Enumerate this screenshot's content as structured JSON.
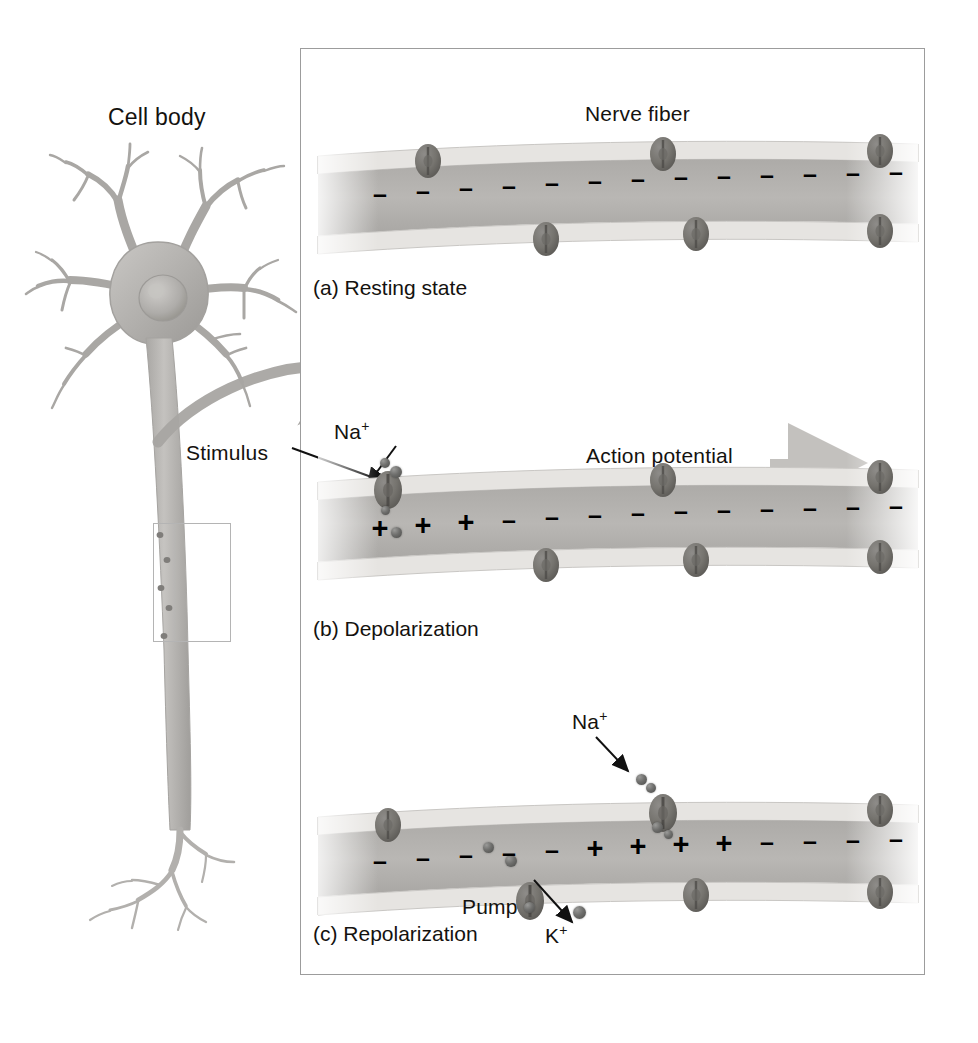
{
  "figure": {
    "title_label": "Cell body",
    "nerve_fiber_label": "Nerve fiber",
    "stimulus_label": "Stimulus"
  },
  "panels": [
    {
      "id": "resting",
      "caption": "(a) Resting state",
      "heading": "Nerve fiber",
      "charges": [
        "-",
        "-",
        "-",
        "-",
        "-",
        "-",
        "-",
        "-",
        "-",
        "-",
        "-",
        "-",
        "-"
      ],
      "channels_top": 3,
      "channels_bottom": 3,
      "annotations": []
    },
    {
      "id": "depolarization",
      "caption": "(b) Depolarization",
      "heading": "Action potential",
      "charges": [
        "+",
        "+",
        "+",
        "-",
        "-",
        "-",
        "-",
        "-",
        "-",
        "-",
        "-",
        "-",
        "-"
      ],
      "channels_top": 3,
      "channels_bottom": 3,
      "annotations": [
        "Na",
        "Stimulus",
        "Action potential"
      ]
    },
    {
      "id": "repolarization",
      "caption": "(c) Repolarization",
      "heading": "",
      "charges": [
        "-",
        "-",
        "-",
        "-",
        "-",
        "+",
        "+",
        "+",
        "+",
        "-",
        "-",
        "-",
        "-"
      ],
      "channels_top": 3,
      "channels_bottom": 3,
      "annotations": [
        "Na",
        "Pump",
        "K"
      ]
    }
  ],
  "ion_labels": {
    "sodium_base": "Na",
    "sodium_sup": "+",
    "potassium_base": "K",
    "potassium_sup": "+",
    "pump": "Pump"
  },
  "colors": {
    "frame_border": "#9c9c9c",
    "membrane_band": "#e2e0dd",
    "cytoplasm": "#b9b7b4",
    "channel": "#7d7b78",
    "text": "#14120f",
    "neuron_body": "#b0aeab",
    "arrow_gray": "#bdbbb8"
  }
}
